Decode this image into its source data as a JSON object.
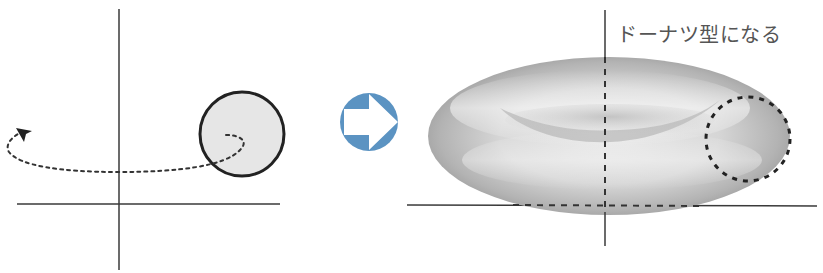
{
  "diagram": {
    "annotation": "ドーナツ型になる",
    "colors": {
      "axis": "#3a3a3a",
      "circle_fill": "#e6e6e6",
      "circle_stroke": "#222222",
      "path_dots": "#333333",
      "arrow_blue": "#5b93c2",
      "torus_light": "#f2f2f2",
      "torus_dark": "#9a9a9a"
    },
    "left_panel": {
      "description": "circle to be rotated about the vertical axis",
      "rotation_direction": "counter-clockwise around vertical axis"
    },
    "transition": {
      "icon": "right-arrow"
    },
    "right_panel": {
      "description": "resulting torus (solid of revolution) with dashed cross-section circle"
    }
  }
}
